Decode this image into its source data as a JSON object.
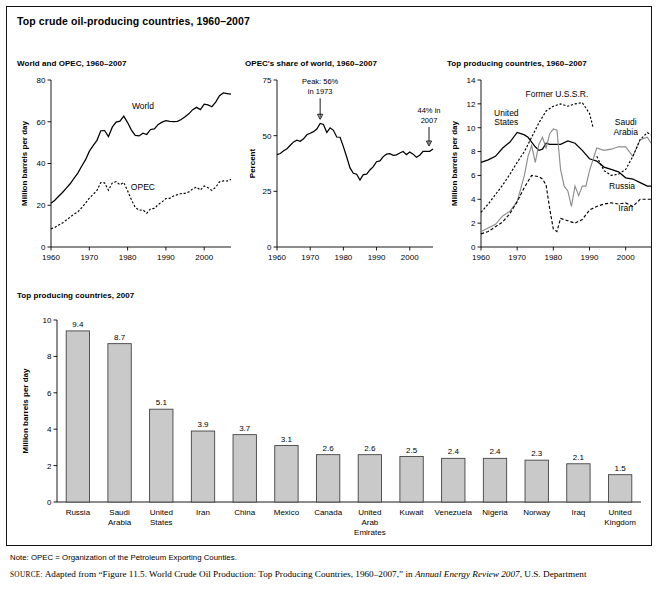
{
  "figure": {
    "title": "Top crude oil-producing countries, 1960–2007",
    "note": "Note: OPEC = Organization of the Petroleum Exporting Counties.",
    "source_prefix": "SOURCE:",
    "source_part1": " Adapted from “Figure 11.5. World Crude Oil Production: Top Producing Countries, 1960–2007,” in ",
    "source_italic": "Annual Energy Review 2007",
    "source_part2": ", U.S. Department"
  },
  "colors": {
    "bar_fill": "#c9c9c9",
    "bar_stroke": "#3a3a3a",
    "axis": "#000000",
    "gray_series": "#8d8d8d"
  },
  "chart_data": [
    {
      "id": "world-and-opec",
      "type": "line",
      "title": "World and OPEC, 1960–2007",
      "xlabel": "",
      "ylabel": "Million barrels per day",
      "xlim": [
        1960,
        2007
      ],
      "ylim": [
        0,
        80
      ],
      "xticks": [
        1960,
        1970,
        1980,
        1990,
        2000
      ],
      "yticks": [
        0,
        20,
        40,
        60,
        80
      ],
      "grid": false,
      "legend": "inline-labels",
      "series": [
        {
          "name": "World",
          "style": "solid",
          "label_x": 1984,
          "label_y": 66,
          "x": [
            1960,
            1961,
            1962,
            1963,
            1964,
            1965,
            1966,
            1967,
            1968,
            1969,
            1970,
            1971,
            1972,
            1973,
            1974,
            1975,
            1976,
            1977,
            1978,
            1979,
            1980,
            1981,
            1982,
            1983,
            1984,
            1985,
            1986,
            1987,
            1988,
            1989,
            1990,
            1991,
            1992,
            1993,
            1994,
            1995,
            1996,
            1997,
            1998,
            1999,
            2000,
            2001,
            2002,
            2003,
            2004,
            2005,
            2006,
            2007
          ],
          "values": [
            21.0,
            22.4,
            24.3,
            26.1,
            28.2,
            30.3,
            32.9,
            35.4,
            38.7,
            41.7,
            45.8,
            48.6,
            51.1,
            55.7,
            55.8,
            52.9,
            57.4,
            59.8,
            60.3,
            62.7,
            59.6,
            56.0,
            53.5,
            53.2,
            54.5,
            53.9,
            56.3,
            56.6,
            58.7,
            59.8,
            60.5,
            60.2,
            60.1,
            60.2,
            61.1,
            62.4,
            63.8,
            65.8,
            66.9,
            65.8,
            68.4,
            68.1,
            67.2,
            69.4,
            72.5,
            73.8,
            73.5,
            73.2
          ]
        },
        {
          "name": "OPEC",
          "style": "dotted",
          "label_x": 1984,
          "label_y": 27.5,
          "x": [
            1960,
            1961,
            1962,
            1963,
            1964,
            1965,
            1966,
            1967,
            1968,
            1969,
            1970,
            1971,
            1972,
            1973,
            1974,
            1975,
            1976,
            1977,
            1978,
            1979,
            1980,
            1981,
            1982,
            1983,
            1984,
            1985,
            1986,
            1987,
            1988,
            1989,
            1990,
            1991,
            1992,
            1993,
            1994,
            1995,
            1996,
            1997,
            1998,
            1999,
            2000,
            2001,
            2002,
            2003,
            2004,
            2005,
            2006,
            2007
          ],
          "values": [
            8.7,
            9.4,
            10.5,
            11.5,
            12.9,
            14.3,
            15.8,
            16.8,
            18.8,
            21.0,
            23.4,
            25.2,
            27.1,
            30.9,
            30.7,
            27.2,
            30.7,
            31.3,
            29.8,
            30.9,
            26.9,
            22.6,
            19.0,
            17.6,
            17.8,
            16.2,
            18.3,
            18.5,
            20.3,
            21.6,
            23.2,
            23.3,
            24.4,
            25.1,
            25.6,
            25.7,
            26.4,
            27.8,
            28.7,
            27.3,
            29.2,
            28.4,
            27.1,
            28.6,
            31.2,
            31.7,
            31.6,
            32.4
          ]
        }
      ]
    },
    {
      "id": "opec-share",
      "type": "line",
      "title": "OPEC's share of world, 1960–2007",
      "xlabel": "",
      "ylabel": "Percent",
      "xlim": [
        1960,
        2007
      ],
      "ylim": [
        0,
        75
      ],
      "xticks": [
        1960,
        1970,
        1980,
        1990,
        2000
      ],
      "yticks": [
        0,
        25,
        50,
        75
      ],
      "grid": false,
      "annotations": [
        {
          "text_line1": "Peak: 56%",
          "text_line2": "in 1973",
          "at_x": 1973,
          "at_y": 56
        },
        {
          "text_line1": "44% in",
          "text_line2": "2007",
          "at_x": 2007,
          "at_y": 44
        }
      ],
      "series": [
        {
          "name": "OPEC share of world",
          "style": "solid",
          "x": [
            1960,
            1961,
            1962,
            1963,
            1964,
            1965,
            1966,
            1967,
            1968,
            1969,
            1970,
            1971,
            1972,
            1973,
            1974,
            1975,
            1976,
            1977,
            1978,
            1979,
            1980,
            1981,
            1982,
            1983,
            1984,
            1985,
            1986,
            1987,
            1988,
            1989,
            1990,
            1991,
            1992,
            1993,
            1994,
            1995,
            1996,
            1997,
            1998,
            1999,
            2000,
            2001,
            2002,
            2003,
            2004,
            2005,
            2006,
            2007
          ],
          "values": [
            41.5,
            42.0,
            43.2,
            44.1,
            45.7,
            47.2,
            48.0,
            47.5,
            48.6,
            50.4,
            51.1,
            51.8,
            53.0,
            55.5,
            55.0,
            51.4,
            53.5,
            52.4,
            49.4,
            49.3,
            45.1,
            40.4,
            35.5,
            33.1,
            32.7,
            30.1,
            32.5,
            32.7,
            34.6,
            36.1,
            38.3,
            38.7,
            40.6,
            41.7,
            41.9,
            41.2,
            41.4,
            42.2,
            42.9,
            41.5,
            42.7,
            41.7,
            40.3,
            41.2,
            43.0,
            43.0,
            43.0,
            44.0
          ]
        }
      ]
    },
    {
      "id": "top-producers-timeseries",
      "type": "line",
      "title": "Top producing countries, 1960–2007",
      "xlabel": "",
      "ylabel": "Million barrels per day",
      "xlim": [
        1960,
        2007
      ],
      "ylim": [
        0,
        14
      ],
      "xticks": [
        1960,
        1970,
        1980,
        1990,
        2000
      ],
      "yticks": [
        0,
        2,
        4,
        6,
        8,
        10,
        12,
        14
      ],
      "grid": false,
      "legend": "inline-labels",
      "series": [
        {
          "name": "United States",
          "style": "solid",
          "label_x": 1967,
          "label_y": 11.0,
          "x": [
            1960,
            1962,
            1964,
            1966,
            1968,
            1970,
            1971,
            1972,
            1973,
            1974,
            1975,
            1976,
            1977,
            1978,
            1979,
            1980,
            1982,
            1984,
            1986,
            1988,
            1990,
            1992,
            1994,
            1996,
            1998,
            2000,
            2002,
            2004,
            2006,
            2007
          ],
          "values": [
            7.1,
            7.3,
            7.6,
            8.3,
            8.8,
            9.6,
            9.5,
            9.4,
            9.2,
            8.8,
            8.4,
            8.1,
            8.2,
            8.7,
            8.6,
            8.6,
            8.6,
            8.9,
            8.7,
            8.1,
            7.4,
            7.2,
            6.7,
            6.5,
            6.3,
            5.8,
            5.7,
            5.4,
            5.1,
            5.1
          ]
        },
        {
          "name": "Former U.S.S.R.",
          "style": "dotted",
          "label_x": 1981,
          "label_y": 12.6,
          "x": [
            1960,
            1962,
            1964,
            1966,
            1968,
            1970,
            1972,
            1974,
            1976,
            1978,
            1980,
            1982,
            1984,
            1986,
            1988,
            1990,
            1991
          ],
          "values": [
            2.9,
            3.6,
            4.4,
            5.2,
            6.1,
            7.1,
            8.0,
            9.2,
            10.4,
            11.4,
            11.8,
            12.0,
            11.8,
            12.0,
            12.1,
            11.2,
            10.0
          ]
        },
        {
          "name": "Saudi Arabia",
          "style": "gray",
          "label_x": 2000,
          "label_y": 10.2,
          "x": [
            1960,
            1962,
            1964,
            1966,
            1968,
            1970,
            1972,
            1973,
            1974,
            1975,
            1976,
            1977,
            1978,
            1979,
            1980,
            1981,
            1982,
            1983,
            1984,
            1985,
            1986,
            1987,
            1988,
            1989,
            1990,
            1992,
            1994,
            1996,
            1998,
            2000,
            2002,
            2004,
            2006,
            2007
          ],
          "values": [
            1.3,
            1.6,
            1.9,
            2.6,
            3.0,
            3.8,
            6.0,
            7.6,
            8.5,
            7.1,
            8.6,
            9.2,
            8.3,
            9.5,
            9.9,
            9.8,
            6.5,
            5.1,
            4.7,
            3.4,
            5.1,
            4.3,
            5.1,
            5.1,
            6.4,
            8.3,
            8.1,
            8.2,
            8.4,
            8.4,
            7.6,
            9.0,
            9.2,
            8.7
          ]
        },
        {
          "name": "Russia",
          "style": "dotted-thin",
          "label_x": 1999,
          "label_y": 4.9,
          "x": [
            1992,
            1994,
            1996,
            1998,
            2000,
            2002,
            2004,
            2006,
            2007
          ],
          "values": [
            7.6,
            6.4,
            6.0,
            6.1,
            6.5,
            7.6,
            9.0,
            9.6,
            9.4
          ]
        },
        {
          "name": "Iran",
          "style": "dashed",
          "label_x": 2000,
          "label_y": 3.0,
          "x": [
            1960,
            1962,
            1964,
            1966,
            1968,
            1970,
            1972,
            1974,
            1976,
            1977,
            1978,
            1979,
            1980,
            1981,
            1982,
            1984,
            1986,
            1988,
            1990,
            1992,
            1994,
            1996,
            1998,
            2000,
            2002,
            2004,
            2006,
            2007
          ],
          "values": [
            1.1,
            1.3,
            1.7,
            2.1,
            2.8,
            3.8,
            5.0,
            6.0,
            5.9,
            5.7,
            5.2,
            3.2,
            1.5,
            1.3,
            2.4,
            2.2,
            2.0,
            2.3,
            3.1,
            3.4,
            3.6,
            3.7,
            3.6,
            3.7,
            3.4,
            4.0,
            4.0,
            4.0
          ]
        }
      ]
    },
    {
      "id": "top-producers-2007",
      "type": "bar",
      "title": "Top producing countries, 2007",
      "xlabel": "",
      "ylabel": "Million barrels per day",
      "ylim": [
        0,
        10
      ],
      "yticks": [
        0,
        2,
        4,
        6,
        8,
        10
      ],
      "grid": false,
      "categories": [
        "Russia",
        "Saudi Arabia",
        "United States",
        "Iran",
        "China",
        "Mexico",
        "Canada",
        "United Arab Emirates",
        "Kuwait",
        "Venezuela",
        "Nigeria",
        "Norway",
        "Iraq",
        "United Kingdom"
      ],
      "values": [
        9.4,
        8.7,
        5.1,
        3.9,
        3.7,
        3.1,
        2.6,
        2.6,
        2.5,
        2.4,
        2.4,
        2.3,
        2.1,
        1.5
      ],
      "value_labels": [
        "9.4",
        "8.7",
        "5.1",
        "3.9",
        "3.7",
        "3.1",
        "2.6",
        "2.6",
        "2.5",
        "2.4",
        "2.4",
        "2.3",
        "2.1",
        "1.5"
      ]
    }
  ]
}
